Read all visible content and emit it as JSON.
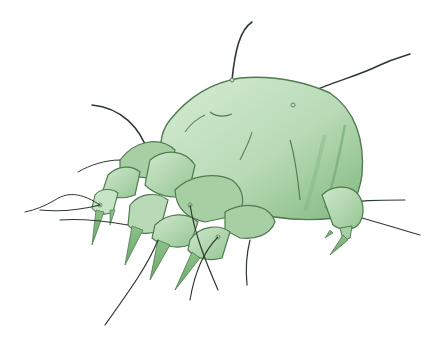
{
  "image": {
    "subject": "Dust mite illustration",
    "background": "#ffffff",
    "colors": {
      "body_light": "#c8e4c6",
      "body_mid": "#a6d0a4",
      "body_dark": "#79b377",
      "outline": "#4f7b4f",
      "hair": "#2e3a30"
    }
  }
}
